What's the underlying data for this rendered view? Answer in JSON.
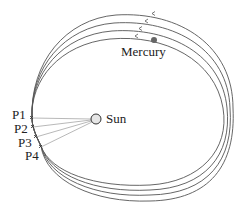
{
  "diagram": {
    "title": "",
    "labels": {
      "sun": "Sun",
      "mercury": "Mercury",
      "p1": "P1",
      "p2": "P2",
      "p3": "P3",
      "p4": "P4"
    },
    "colors": {
      "orbit": "#555555",
      "sun_fill": "#e6e6e6",
      "sun_stroke": "#333333",
      "mercury": "#666666",
      "lines": "#999999",
      "text": "#222222"
    },
    "orbits": [
      {
        "name": "orbit-1",
        "top_y": 38,
        "right_x": 223,
        "bottom_y": 185
      },
      {
        "name": "orbit-2",
        "top_y": 31,
        "right_x": 227,
        "bottom_y": 190
      },
      {
        "name": "orbit-3",
        "top_y": 23,
        "right_x": 230,
        "bottom_y": 195
      },
      {
        "name": "orbit-4",
        "top_y": 15,
        "right_x": 233,
        "bottom_y": 201
      }
    ],
    "perihelion_points": [
      "P1",
      "P2",
      "P3",
      "P4"
    ]
  }
}
